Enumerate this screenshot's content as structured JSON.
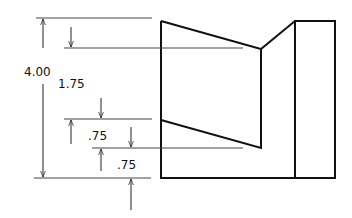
{
  "drawing": {
    "type": "dimensioned orthographic view",
    "line_color": "#111111",
    "dim_line_color": "#333333",
    "dimensions": {
      "overall_height": "4.00",
      "upper_step": "1.75",
      "middle_step": ".75",
      "lower_step": ".75"
    }
  }
}
